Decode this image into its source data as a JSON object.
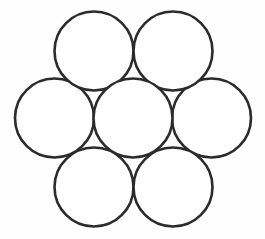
{
  "figure": {
    "name": "seven-circle-hexagonal-packing",
    "title": "Seven tangent circles in hexagonal packing",
    "background_color": "#fefefe",
    "stroke_color": "#2b2b2b",
    "fill_color": "#ffffff",
    "stroke_width": 2.6,
    "circle_count": 7,
    "canvas": {
      "width": 265,
      "height": 239
    }
  },
  "chart_data": {
    "type": "diagram",
    "title": "Seven tangent circles in hexagonal packing",
    "subtitle": "",
    "xlabel": "",
    "ylabel": "",
    "grid": false,
    "legend": false,
    "radius": 39.5,
    "circles": [
      {
        "id": "center",
        "label": "center circle",
        "cx": 133.0,
        "cy": 118.0,
        "r": 39.5
      },
      {
        "id": "middle-left",
        "label": "middle-left circle",
        "cx": 54.5,
        "cy": 118.0,
        "r": 39.5
      },
      {
        "id": "middle-right",
        "label": "middle-right circle",
        "cx": 211.5,
        "cy": 118.0,
        "r": 39.5
      },
      {
        "id": "top-left",
        "label": "top-left circle",
        "cx": 94.0,
        "cy": 51.0,
        "r": 39.5
      },
      {
        "id": "top-right",
        "label": "top-right circle",
        "cx": 173.0,
        "cy": 51.0,
        "r": 39.5
      },
      {
        "id": "bottom-left",
        "label": "bottom-left circle",
        "cx": 94.0,
        "cy": 187.0,
        "r": 39.5
      },
      {
        "id": "bottom-right",
        "label": "bottom-right circle",
        "cx": 173.0,
        "cy": 187.0,
        "r": 39.5
      }
    ],
    "annotations": []
  }
}
